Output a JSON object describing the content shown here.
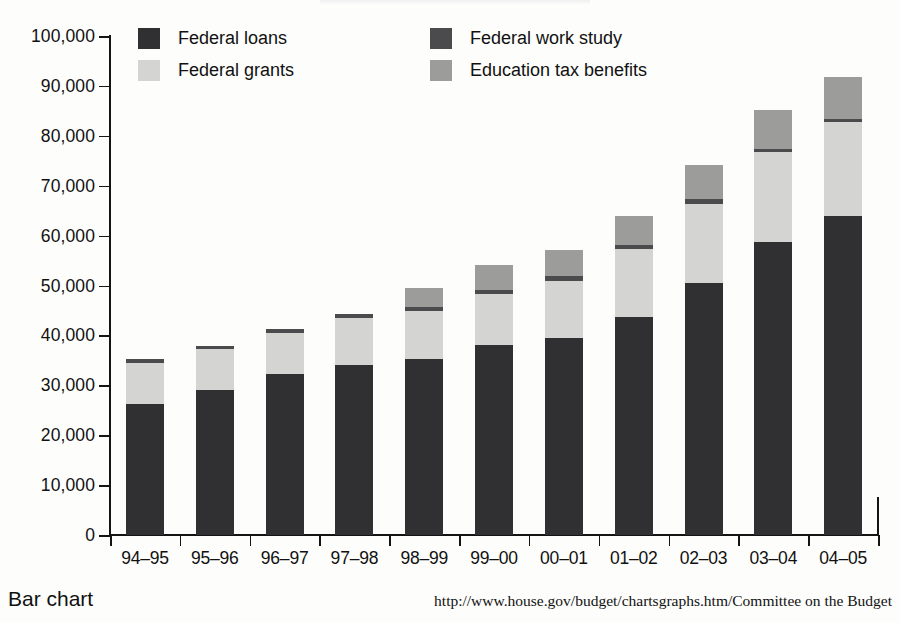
{
  "caption": {
    "label": "Bar chart",
    "source": "http://www.house.gov/budget/chartsgraphs.htm/Committee on the Budget"
  },
  "legend": {
    "position": "top-inside",
    "items": [
      {
        "label": "Federal loans",
        "color": "#302f31",
        "swatch_name": "legend-swatch-federal-loans"
      },
      {
        "label": "Federal grants",
        "color": "#d4d4d2",
        "swatch_name": "legend-swatch-federal-grants"
      },
      {
        "label": "Federal work study",
        "color": "#4b4a4c",
        "swatch_name": "legend-swatch-federal-work-study"
      },
      {
        "label": "Education tax benefits",
        "color": "#9c9c9a",
        "swatch_name": "legend-swatch-education-tax-benefits"
      }
    ]
  },
  "chart_data": {
    "type": "bar",
    "stacked": true,
    "title": "",
    "xlabel": "",
    "ylabel": "",
    "ylim": [
      0,
      100000
    ],
    "ytick_values": [
      0,
      10000,
      20000,
      30000,
      40000,
      50000,
      60000,
      70000,
      80000,
      90000,
      100000
    ],
    "ytick_labels": [
      "0",
      "10,000",
      "20,000",
      "30,000",
      "40,000",
      "50,000",
      "60,000",
      "70,000",
      "80,000",
      "90,000",
      "100,000"
    ],
    "grid": false,
    "categories": [
      "94–95",
      "95–96",
      "96–97",
      "97–98",
      "98–99",
      "99–00",
      "00–01",
      "01–02",
      "02–03",
      "03–04",
      "04–05"
    ],
    "series": [
      {
        "name": "Federal loans",
        "color": "#302f31",
        "values": [
          26300,
          29000,
          32300,
          34100,
          35200,
          38100,
          39500,
          43600,
          50500,
          58800,
          64000
        ]
      },
      {
        "name": "Federal grants",
        "color": "#d4d4d2",
        "values": [
          8200,
          8200,
          8200,
          9300,
          9600,
          10200,
          11500,
          13700,
          15900,
          18000,
          18700
        ]
      },
      {
        "name": "Federal work study",
        "color": "#4b4a4c",
        "values": [
          700,
          700,
          800,
          800,
          800,
          800,
          900,
          900,
          900,
          600,
          600
        ]
      },
      {
        "name": "Education tax benefits",
        "color": "#9c9c9a",
        "values": [
          0,
          0,
          0,
          0,
          3900,
          5000,
          5200,
          5800,
          6800,
          7700,
          8500
        ]
      }
    ],
    "totals": [
      35200,
      37900,
      41300,
      44200,
      49500,
      54100,
      57100,
      64000,
      74100,
      85100,
      91800
    ]
  }
}
